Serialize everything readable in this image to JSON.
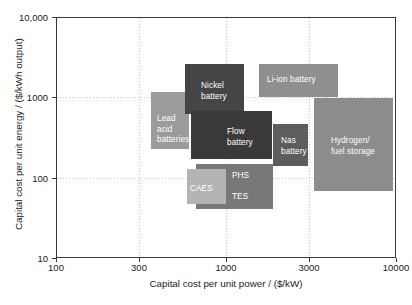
{
  "chart_data": {
    "type": "bar",
    "title": "",
    "xlabel": "Capital cost per unit power / ($/kW)",
    "ylabel": "Capital cost per unit energy / ($/kWh output)",
    "xscale": "log",
    "yscale": "log",
    "xlim": [
      100,
      10000
    ],
    "ylim": [
      10,
      10000
    ],
    "xticks": [
      100,
      300,
      1000,
      3000,
      10000
    ],
    "xtick_labels": [
      "100",
      "300",
      "1000",
      "3000",
      "10000"
    ],
    "yticks": [
      10,
      100,
      1000,
      10000
    ],
    "ytick_labels": [
      "10",
      "100",
      "1000",
      "10,000"
    ],
    "grid": "dotted gridlines at 300, 1000, 3000 (x) and 100, 1000 (y)",
    "legend": "none - regions labelled in place",
    "regions": [
      {
        "name": "Lead acid batteries",
        "label": "Lead\nacid\nbatteries",
        "x_range": [
          340,
          800
        ],
        "y_range": [
          200,
          1400
        ],
        "color": "#9b9b9b",
        "px": {
          "left": 94,
          "top": 74,
          "width": 38,
          "height": 57
        },
        "label_px": {
          "left": 6,
          "top": 22
        },
        "z": 2
      },
      {
        "name": "Nickel battery",
        "label": "Nickel\nbattery",
        "x_range": [
          680,
          2100
        ],
        "y_range": [
          500,
          2800
        ],
        "color": "#454545",
        "px": {
          "left": 128,
          "top": 46,
          "width": 59,
          "height": 50
        },
        "label_px": {
          "left": 16,
          "top": 17
        },
        "z": 3
      },
      {
        "name": "Flow battery",
        "label": "Flow battery",
        "x_range": [
          740,
          3200
        ],
        "y_range": [
          130,
          620
        ],
        "color": "#3a3a3a",
        "px": {
          "left": 134,
          "top": 93,
          "width": 81,
          "height": 48
        },
        "label_px": {
          "left": 36,
          "top": 16
        },
        "z": 4
      },
      {
        "name": "Li-ion battery",
        "label": "Li-ion battery",
        "x_range": [
          2000,
          9000
        ],
        "y_range": [
          900,
          2900
        ],
        "color": "#8f8f8f",
        "px": {
          "left": 202,
          "top": 46,
          "width": 79,
          "height": 33
        },
        "label_px": {
          "left": 8,
          "top": 11
        },
        "z": 2
      },
      {
        "name": "Nas battery",
        "label": "Nas\nbattery",
        "x_range": [
          2400,
          4200
        ],
        "y_range": [
          170,
          560
        ],
        "color": "#5d5d5d",
        "px": {
          "left": 216,
          "top": 106,
          "width": 35,
          "height": 42
        },
        "label_px": {
          "left": 8,
          "top": 12
        },
        "z": 5
      },
      {
        "name": "Hydrogen/fuel storage",
        "label": "Hydrogen/\nfuel storage",
        "x_range": [
          3000,
          9500
        ],
        "y_range": [
          60,
          1000
        ],
        "color": "#8c8c8c",
        "px": {
          "left": 257,
          "top": 80,
          "width": 79,
          "height": 93
        },
        "label_px": {
          "left": 17,
          "top": 38
        },
        "z": 1
      },
      {
        "name": "PHS TES",
        "label": "PHS\n\nTES",
        "x_range": [
          800,
          2500
        ],
        "y_range": [
          35,
          140
        ],
        "color": "#787878",
        "px": {
          "left": 139,
          "top": 146,
          "width": 77,
          "height": 45
        },
        "label_px": {
          "left": 36,
          "top": 7
        },
        "z": 2
      },
      {
        "name": "CAES",
        "label": "CAES",
        "x_range": [
          640,
          1250
        ],
        "y_range": [
          42,
          110
        ],
        "color": "#b4b4b4",
        "px": {
          "left": 130,
          "top": 151,
          "width": 39,
          "height": 35
        },
        "label_px": {
          "left": 3,
          "top": 15
        },
        "z": 3
      }
    ]
  },
  "axes": {
    "x_title": "Capital cost per unit power / ($/kW)",
    "y_title": "Capital cost per unit energy / ($/kWh output)",
    "x_ticks": [
      {
        "label": "100",
        "px": 56
      },
      {
        "label": "300",
        "px": 139
      },
      {
        "label": "1000",
        "px": 226
      },
      {
        "label": "3000",
        "px": 309
      },
      {
        "label": "10000",
        "px": 396
      }
    ],
    "y_ticks": [
      {
        "label": "10,000",
        "px": 17
      },
      {
        "label": "1000",
        "px": 97
      },
      {
        "label": "100",
        "px": 178
      },
      {
        "label": "10",
        "px": 258
      }
    ],
    "gridlines_v_px": [
      139,
      226,
      309
    ],
    "gridlines_h_px": [
      97,
      178
    ]
  },
  "colors": {
    "frame": "#3a3a3a",
    "grid": "#c9c9c9",
    "background": "#ffffff",
    "text": "#1a1a1a",
    "label_text": "#ffffff"
  }
}
